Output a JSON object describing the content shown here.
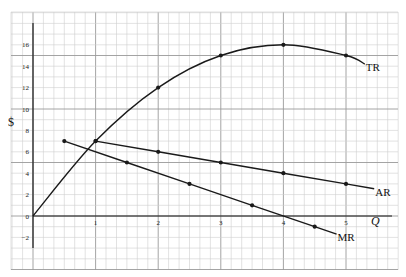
{
  "chart_data": {
    "type": "line",
    "title": "",
    "xlabel": "Q",
    "ylabel": "$",
    "xlim": [
      -1,
      5.8
    ],
    "ylim": [
      -4,
      19
    ],
    "grid": true,
    "legend_position": "inline labels at line ends",
    "x_ticks": [
      "1",
      "2",
      "3",
      "4",
      "5"
    ],
    "y_ticks": [
      "-2",
      "0",
      "2",
      "4",
      "6",
      "8",
      "10",
      "12",
      "14",
      "16"
    ],
    "series": [
      {
        "name": "TR",
        "points": [
          [
            0,
            0
          ],
          [
            1,
            7
          ],
          [
            2,
            12
          ],
          [
            3,
            15
          ],
          [
            4,
            16
          ],
          [
            5,
            15
          ]
        ],
        "marked_points": [
          [
            1,
            7
          ],
          [
            2,
            12
          ],
          [
            3,
            15
          ],
          [
            4,
            16
          ],
          [
            5,
            15
          ]
        ],
        "end": [
          5.3,
          14.2
        ],
        "curve": true
      },
      {
        "name": "AR",
        "points": [
          [
            1,
            7
          ],
          [
            2,
            6
          ],
          [
            3,
            5
          ],
          [
            4,
            4
          ],
          [
            5,
            3
          ]
        ],
        "marked_points": [
          [
            1,
            7
          ],
          [
            2,
            6
          ],
          [
            3,
            5
          ],
          [
            4,
            4
          ],
          [
            5,
            3
          ]
        ],
        "end": [
          5.45,
          2.55
        ],
        "curve": false
      },
      {
        "name": "MR",
        "points": [
          [
            0.5,
            7
          ],
          [
            1.5,
            5
          ],
          [
            2.5,
            3
          ],
          [
            3.5,
            1
          ],
          [
            4.5,
            -1
          ]
        ],
        "marked_points": [
          [
            0.5,
            7
          ],
          [
            1.5,
            5
          ],
          [
            2.5,
            3
          ],
          [
            3.5,
            1
          ],
          [
            4.5,
            -1
          ]
        ],
        "end": [
          4.85,
          -1.7
        ],
        "curve": false
      }
    ]
  },
  "labels": {
    "y_axis": "$",
    "x_axis": "Q",
    "origin": "0"
  },
  "colors": {
    "line": "#1a1a1a",
    "grid_minor": "#cfcfcf",
    "grid_major": "#9a9a9a",
    "background": "#ffffff"
  }
}
